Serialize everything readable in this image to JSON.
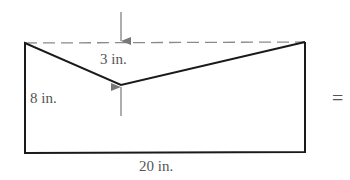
{
  "figure": {
    "labels": {
      "top_depth": "3 in.",
      "side_height": "8 in.",
      "bottom_width": "20 in.",
      "equals": "="
    },
    "colors": {
      "outline": "#1a1a1a",
      "dashed": "#8a8a8a",
      "arrow": "#777777",
      "text": "#555555"
    }
  }
}
